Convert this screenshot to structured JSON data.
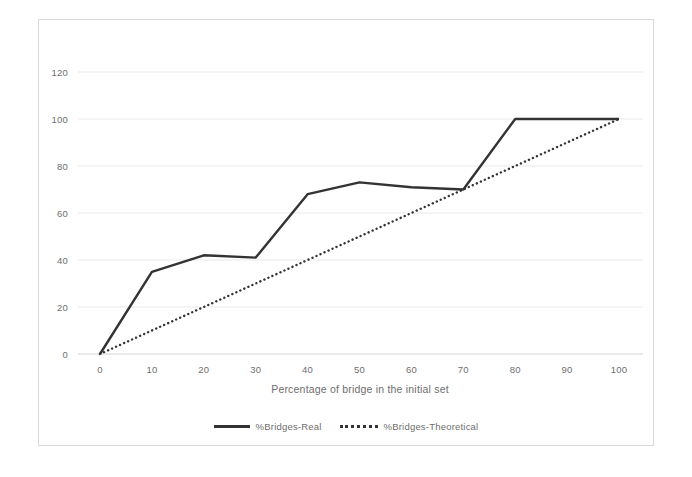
{
  "chart_data": {
    "type": "line",
    "title": "",
    "xlabel": "Percentage of bridge in the initial set",
    "ylabel": "",
    "xlim": [
      0,
      100
    ],
    "ylim": [
      0,
      120
    ],
    "x_ticks": [
      0,
      10,
      20,
      30,
      40,
      50,
      60,
      70,
      80,
      90,
      100
    ],
    "y_ticks": [
      0,
      20,
      40,
      60,
      80,
      100,
      120
    ],
    "grid": "horizontal-light",
    "legend_position": "bottom-center",
    "x": [
      0,
      10,
      20,
      30,
      40,
      50,
      60,
      70,
      80,
      90,
      100
    ],
    "series": [
      {
        "name": "%Bridges-Real",
        "line_style": "solid",
        "values": [
          0,
          35,
          42,
          41,
          68,
          73,
          71,
          70,
          100,
          100,
          100
        ]
      },
      {
        "name": "%Bridges-Theoretical",
        "line_style": "dotted",
        "values": [
          0,
          10,
          20,
          30,
          40,
          50,
          60,
          70,
          80,
          90,
          100
        ]
      }
    ]
  },
  "colors": {
    "series_line": "#333333",
    "gridline": "#e9e9e9",
    "axis_line": "#d4d4d4",
    "tick_text": "#6e6e6e",
    "plot_border": "#dadada",
    "background": "#ffffff"
  }
}
